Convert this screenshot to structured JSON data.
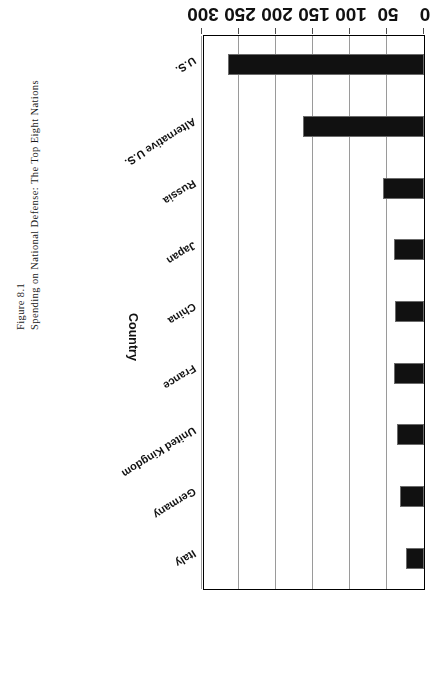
{
  "figure": {
    "number": "Figure 8.1",
    "caption": "Spending on National Defense: The Top Eight Nations"
  },
  "chart_data": {
    "type": "bar",
    "orientation": "horizontal",
    "title": "",
    "xlabel": "Billions of 1999 Dollars",
    "ylabel": "Country",
    "categories": [
      "U.S.",
      "Alternative U.S.",
      "Russia",
      "Japan",
      "China",
      "France",
      "United Kingdom",
      "Germany",
      "Italy"
    ],
    "values": [
      265,
      163,
      55,
      41,
      39,
      40,
      37,
      33,
      24
    ],
    "xlim": [
      0,
      300
    ],
    "xticks": [
      0,
      50,
      100,
      150,
      200,
      250,
      300
    ],
    "xtick_labels": [
      "0",
      "50",
      "100",
      "150",
      "200",
      "250",
      "300"
    ],
    "grid": true,
    "legend": false,
    "bar_color": "#111111",
    "rotation_note": "chart printed upside down (180 degrees)"
  }
}
